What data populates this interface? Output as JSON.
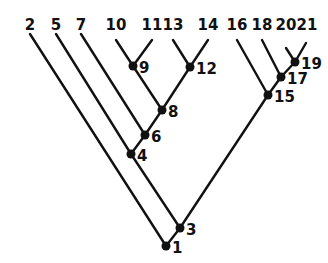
{
  "diagram": {
    "type": "binary-tree",
    "root": "1",
    "leaves": [
      {
        "id": "2",
        "label": "2",
        "x": 30,
        "y": 41
      },
      {
        "id": "5",
        "label": "5",
        "x": 56,
        "y": 41
      },
      {
        "id": "7",
        "label": "7",
        "x": 81,
        "y": 41
      },
      {
        "id": "10",
        "label": "10",
        "x": 116,
        "y": 41
      },
      {
        "id": "11",
        "label": "11",
        "x": 152,
        "y": 41
      },
      {
        "id": "13",
        "label": "13",
        "x": 173,
        "y": 41
      },
      {
        "id": "14",
        "label": "14",
        "x": 208,
        "y": 41
      },
      {
        "id": "16",
        "label": "16",
        "x": 237,
        "y": 41
      },
      {
        "id": "18",
        "label": "18",
        "x": 262,
        "y": 41
      },
      {
        "id": "20",
        "label": "20",
        "x": 286,
        "y": 48
      },
      {
        "id": "21",
        "label": "21",
        "x": 306,
        "y": 41
      }
    ],
    "internal_nodes": [
      {
        "id": "1",
        "label": "1",
        "x": 166,
        "y": 246
      },
      {
        "id": "3",
        "label": "3",
        "x": 180,
        "y": 228
      },
      {
        "id": "4",
        "label": "4",
        "x": 131,
        "y": 154
      },
      {
        "id": "6",
        "label": "6",
        "x": 145,
        "y": 135
      },
      {
        "id": "8",
        "label": "8",
        "x": 162,
        "y": 110
      },
      {
        "id": "9",
        "label": "9",
        "x": 133,
        "y": 66
      },
      {
        "id": "12",
        "label": "12",
        "x": 190,
        "y": 67
      },
      {
        "id": "15",
        "label": "15",
        "x": 268,
        "y": 95
      },
      {
        "id": "17",
        "label": "17",
        "x": 281,
        "y": 77
      },
      {
        "id": "19",
        "label": "19",
        "x": 295,
        "y": 62
      }
    ],
    "edges": [
      [
        "1",
        "2"
      ],
      [
        "1",
        "3"
      ],
      [
        "3",
        "4"
      ],
      [
        "3",
        "15"
      ],
      [
        "4",
        "5"
      ],
      [
        "4",
        "6"
      ],
      [
        "6",
        "7"
      ],
      [
        "6",
        "8"
      ],
      [
        "8",
        "9"
      ],
      [
        "8",
        "12"
      ],
      [
        "9",
        "10"
      ],
      [
        "9",
        "11"
      ],
      [
        "12",
        "13"
      ],
      [
        "12",
        "14"
      ],
      [
        "15",
        "16"
      ],
      [
        "15",
        "17"
      ],
      [
        "17",
        "18"
      ],
      [
        "17",
        "19"
      ],
      [
        "19",
        "20"
      ],
      [
        "19",
        "21"
      ]
    ]
  }
}
